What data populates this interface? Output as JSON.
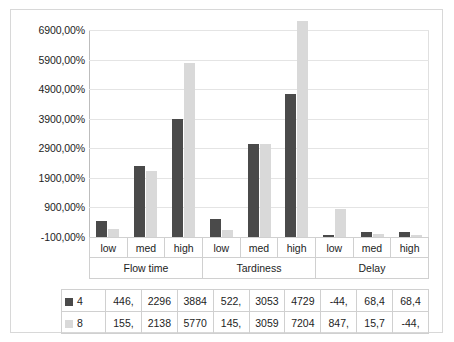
{
  "chart_data": {
    "type": "bar",
    "title": "",
    "xlabel": "",
    "ylabel": "",
    "ylim": [
      -100,
      6900
    ],
    "grid": true,
    "legend_position": "data-table",
    "y_ticks": [
      "-100,00%",
      "900,00%",
      "1900,00%",
      "2900,00%",
      "3900,00%",
      "4900,00%",
      "5900,00%",
      "6900,00%"
    ],
    "y_tick_values": [
      -100,
      900,
      1900,
      2900,
      3900,
      4900,
      5900,
      6900
    ],
    "groups": [
      {
        "name": "Flow time",
        "categories": [
          "low",
          "med",
          "high"
        ]
      },
      {
        "name": "Tardiness",
        "categories": [
          "low",
          "med",
          "high"
        ]
      },
      {
        "name": "Delay",
        "categories": [
          "low",
          "med",
          "high"
        ]
      }
    ],
    "categories": [
      "low",
      "med",
      "high",
      "low",
      "med",
      "high",
      "low",
      "med",
      "high"
    ],
    "series": [
      {
        "name": "4",
        "color": "#4a4a4a",
        "values": [
          446,
          2296,
          3884,
          522,
          3053,
          4729,
          -44,
          68.4,
          68.4
        ],
        "labels": [
          "446,",
          "2296",
          "3884",
          "522,",
          "3053",
          "4729",
          "-44,",
          "68,4",
          "68,4"
        ]
      },
      {
        "name": "8",
        "color": "#d9d9d9",
        "values": [
          155,
          2138,
          5770,
          145,
          3059,
          7204,
          847,
          15.7,
          -44
        ],
        "labels": [
          "155,",
          "2138",
          "5770",
          "145,",
          "3059",
          "7204",
          "847,",
          "15,7",
          "-44,"
        ]
      }
    ]
  },
  "colors": {
    "series_4": "#4a4a4a",
    "series_8": "#d9d9d9",
    "gridline": "#e4e4e4",
    "border": "#d0d0d0",
    "text": "#1d1d1d"
  }
}
